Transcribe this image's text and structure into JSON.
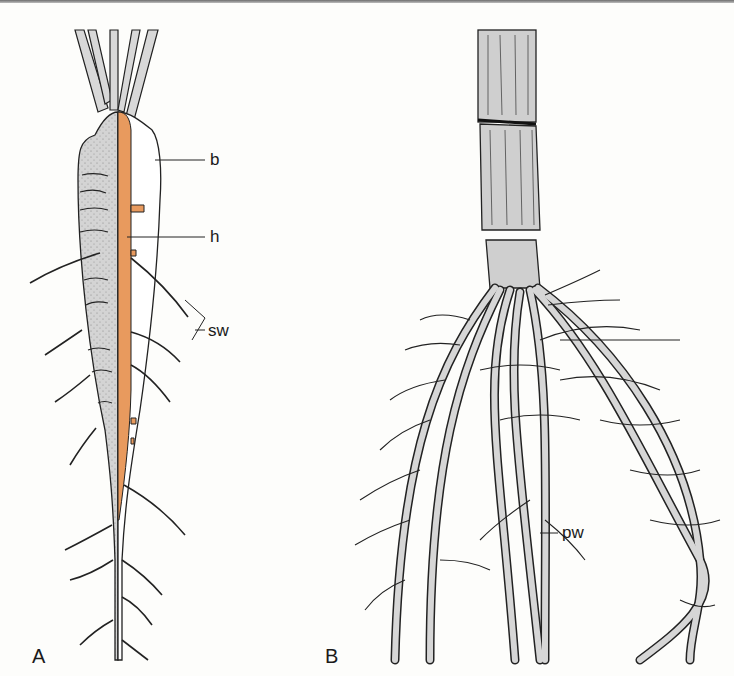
{
  "figure": {
    "panels": [
      {
        "id": "A",
        "label": "A",
        "subject": "tap root (carrot-like storage root), longitudinal half-section",
        "annotations": [
          {
            "key": "b",
            "label": "b"
          },
          {
            "key": "h",
            "label": "h"
          },
          {
            "key": "sw",
            "label": "sw"
          }
        ]
      },
      {
        "id": "B",
        "label": "B",
        "subject": "fibrous root system at stem base",
        "annotations": [
          {
            "key": "pw",
            "label": "pw"
          }
        ]
      }
    ],
    "colors": {
      "background": "#fdfdfb",
      "ink": "#1a1a1a",
      "root_fill": "#d6d6d6",
      "core_orange": "#e89a5e",
      "cortex_white": "#ffffff"
    }
  }
}
